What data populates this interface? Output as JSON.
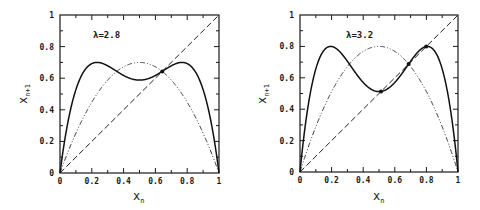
{
  "chart_data": [
    {
      "type": "line",
      "title": "",
      "annotation": "λ=2.8",
      "lambda": 2.8,
      "xlabel": "x",
      "xlabel_sub": "n",
      "ylabel": "x",
      "ylabel_sub": "n+1",
      "xlim": [
        0,
        1
      ],
      "ylim": [
        0,
        1
      ],
      "x_tick_labels": [
        "0",
        "0.2",
        "0.4",
        "0.6",
        "0.8",
        "1"
      ],
      "y_tick_labels": [
        "0",
        "0.2",
        "0.4",
        "0.6",
        "0.8",
        "1"
      ],
      "grid": false,
      "series": [
        {
          "name": "f(f(x)) second iterate",
          "style": "solid",
          "formula": "λ·f(x)·(1−f(x))",
          "peak_values": [
            0.7,
            0.7
          ],
          "local_min": {
            "x": 0.5,
            "y": 0.588
          }
        },
        {
          "name": "f(x) = λx(1−x)",
          "style": "dash-dot",
          "peak": {
            "x": 0.5,
            "y": 0.7
          }
        },
        {
          "name": "x_{n+1} = x_n",
          "style": "dashed",
          "points": [
            [
              0,
              0
            ],
            [
              1,
              1
            ]
          ]
        }
      ],
      "fixed_points": [
        0.643
      ]
    },
    {
      "type": "line",
      "title": "",
      "annotation": "λ=3.2",
      "lambda": 3.2,
      "xlabel": "x",
      "xlabel_sub": "n",
      "ylabel": "x",
      "ylabel_sub": "n+1",
      "xlim": [
        0,
        1
      ],
      "ylim": [
        0,
        1
      ],
      "x_tick_labels": [
        "0",
        "0.2",
        "0.4",
        "0.6",
        "0.8",
        "1"
      ],
      "y_tick_labels": [
        "0",
        "0.2",
        "0.4",
        "0.6",
        "0.8",
        "1"
      ],
      "grid": false,
      "series": [
        {
          "name": "f(f(x)) second iterate",
          "style": "solid",
          "formula": "λ·f(x)·(1−f(x))",
          "peak_values": [
            0.8,
            0.8
          ],
          "local_min": {
            "x": 0.5,
            "y": 0.512
          }
        },
        {
          "name": "f(x) = λx(1−x)",
          "style": "dash-dot",
          "peak": {
            "x": 0.5,
            "y": 0.8
          }
        },
        {
          "name": "x_{n+1} = x_n",
          "style": "dashed",
          "points": [
            [
              0,
              0
            ],
            [
              1,
              1
            ]
          ]
        }
      ],
      "fixed_points": [
        0.513,
        0.6875,
        0.799
      ]
    }
  ],
  "panels": [
    {
      "annotation": "λ=2.8",
      "xlabel": "x",
      "xlabel_sub": "n",
      "ylabel": "x",
      "ylabel_sub": "n+1"
    },
    {
      "annotation": "λ=3.2",
      "xlabel": "x",
      "xlabel_sub": "n",
      "ylabel": "x",
      "ylabel_sub": "n+1"
    }
  ]
}
